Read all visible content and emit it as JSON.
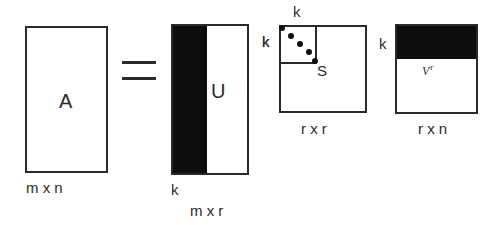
{
  "diagram": {
    "equals_symbol": "=",
    "matrix_a": {
      "label": "A",
      "dims": "m x n"
    },
    "matrix_u": {
      "label": "U",
      "dims": "m x r",
      "k_right": "k",
      "k_bottom": "k"
    },
    "matrix_s": {
      "label": "S",
      "dims": "r x r",
      "k_top": "k",
      "k_left": "k"
    },
    "matrix_v": {
      "label": "V",
      "superscript": "T",
      "dims": "r x n",
      "k_left": "k"
    },
    "colors": {
      "stroke": "#2a2a2a",
      "fill": "#0d0d0d",
      "background": "#ffffff"
    }
  }
}
